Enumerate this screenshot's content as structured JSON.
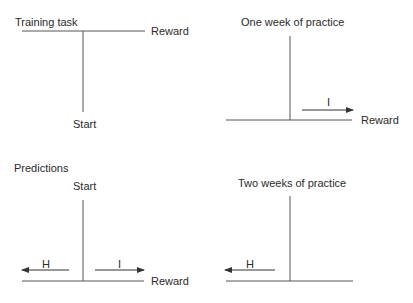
{
  "panels": {
    "training": {
      "title": "Training task",
      "reward_label": "Reward",
      "start_label": "Start"
    },
    "one_week": {
      "title": "One week of practice",
      "arrow_label": "I",
      "reward_label": "Reward"
    },
    "predictions": {
      "title": "Predictions",
      "start_label": "Start",
      "left_arrow_label": "H",
      "right_arrow_label": "I",
      "reward_label": "Reward"
    },
    "two_weeks": {
      "title": "Two weeks of practice",
      "arrow_label": "H"
    }
  },
  "colors": {
    "line": "#555555",
    "text": "#2b2b2b"
  }
}
